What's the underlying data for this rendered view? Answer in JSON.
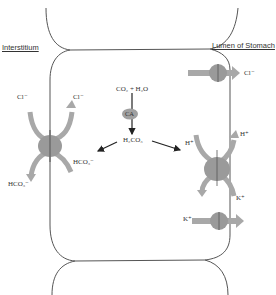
{
  "regions": {
    "left": "Interstitium",
    "right": "Lumen of Stomach"
  },
  "reaction": {
    "reactants": "CO₂ + H₂O",
    "enzyme": "CA",
    "product": "H₂CO₃"
  },
  "left_transporter": {
    "type": "Cl⁻/HCO₃⁻ exchanger",
    "top_left": "Cl⁻",
    "top_right": "Cl⁻",
    "bottom_left": "HCO₃⁻",
    "bottom_right": "HCO₃⁻"
  },
  "right_transporters": {
    "chloride_channel": {
      "ion": "Cl⁻"
    },
    "proton_pump": {
      "top_left": "H⁺",
      "top_right": "H⁺",
      "bottom_right": "K⁺"
    },
    "potassium_channel": {
      "ion": "K⁺"
    }
  },
  "colors": {
    "membrane": "#555555",
    "protein": "#9a9a9a",
    "arrow_fill": "#a8a8a8",
    "ca_oval": "#a0a0a0"
  }
}
